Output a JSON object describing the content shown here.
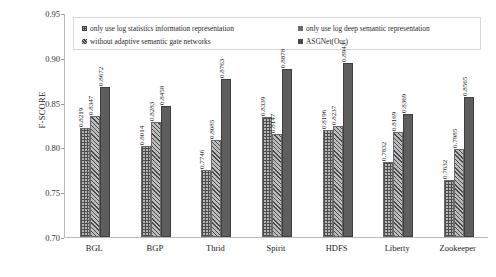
{
  "chart_data": {
    "type": "bar",
    "title": "",
    "xlabel": "",
    "ylabel": "F-SCORE",
    "ylim": [
      0.7,
      0.95
    ],
    "yticks": [
      "0.70",
      "0.75",
      "0.80",
      "0.85",
      "0.90",
      "0.95"
    ],
    "grid": false,
    "legend_position": "top-inside",
    "categories": [
      "BGL",
      "BGP",
      "Thrid",
      "Spirit",
      "HDFS",
      "Liberty",
      "Zookeeper"
    ],
    "series": [
      {
        "name": "only use log statistics information representation",
        "pattern": "crosshatch",
        "color": "#b5b5b5",
        "values": [
          0.8219,
          0.8014,
          0.7746,
          0.8339,
          0.8196,
          0.7832,
          0.7632
        ],
        "labels": [
          "0.8219",
          "0.8014",
          "0.7746",
          "0.8339",
          "0.8196",
          "0.7832",
          "0.7632"
        ]
      },
      {
        "name": "only use log deep semantic representation",
        "pattern": "diagonal-hatch",
        "color": "#bdbdbd",
        "values": [
          0.8347,
          0.8283,
          0.8085,
          0.8147,
          0.8237,
          0.8169,
          0.7985
        ],
        "labels": [
          "0.8347",
          "0.8283",
          "0.8085",
          "0.8147",
          "0.8237",
          "0.8169",
          "0.7985"
        ]
      },
      {
        "name": "ASGNet(Our)",
        "pattern": "solid",
        "color": "#5e5e5e",
        "values": [
          0.8672,
          0.8458,
          0.8763,
          0.8878,
          0.8943,
          0.8369,
          0.8565
        ],
        "labels": [
          "0.8672",
          "0.8458",
          "0.8763",
          "0.8878",
          "0.8943",
          "0.8369",
          "0.8565"
        ]
      }
    ],
    "legend_entries": [
      "only use log statistics information representation",
      "only use log deep semantic representation",
      "without adaptive semantic gate networks",
      "ASGNet(Our)"
    ]
  }
}
